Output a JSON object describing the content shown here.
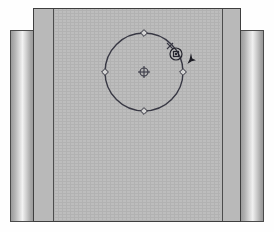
{
  "app": {
    "title": "CAD Drawing Canvas",
    "canvas_label": "drawing-area"
  },
  "colors": {
    "canvas_background": "#bdbdbd",
    "frame_panel": "#b9b9b9",
    "border_dark": "#3e3e3e",
    "geometry_stroke": "#3a3a46",
    "marker_fill": "#d8d8d8",
    "marker_stroke": "#2f2f3a",
    "snap_highlight": "#26262f",
    "cursor": "#1e1e26"
  },
  "panels": {
    "left_band": {
      "name": "left-scroll-band",
      "x": 10,
      "y": 30,
      "width": 24,
      "height": 192
    },
    "right_band": {
      "name": "right-scroll-band",
      "x": 240,
      "y": 30,
      "width": 24,
      "height": 192
    },
    "left_frame": {
      "name": "left-frame-panel",
      "x": 33,
      "y": 8,
      "width": 22,
      "height": 214
    },
    "right_frame": {
      "name": "right-frame-panel",
      "x": 219,
      "y": 8,
      "width": 22,
      "height": 214
    }
  },
  "drawing": {
    "circle": {
      "center_x": 144,
      "center_y": 71,
      "radius": 39,
      "stroke_width": 1.4
    },
    "center_point": {
      "label": "center-snap",
      "x": 144,
      "y": 71,
      "radius": 4
    },
    "quadrant_markers": [
      {
        "label": "quadrant-top",
        "x": 144,
        "y": 32
      },
      {
        "label": "quadrant-left",
        "x": 105,
        "y": 71
      },
      {
        "label": "quadrant-right",
        "x": 183,
        "y": 71
      },
      {
        "label": "quadrant-bottom",
        "x": 144,
        "y": 110
      }
    ],
    "snap_indicator": {
      "label": "snap-point-highlight",
      "x": 176,
      "y": 53,
      "outer_radius": 6,
      "inner_size": 5
    },
    "tangent_tick": {
      "label": "tangent-tick",
      "x": 170,
      "y": 45
    },
    "cursor": {
      "label": "pointer-cursor",
      "x": 191,
      "y": 57
    }
  }
}
